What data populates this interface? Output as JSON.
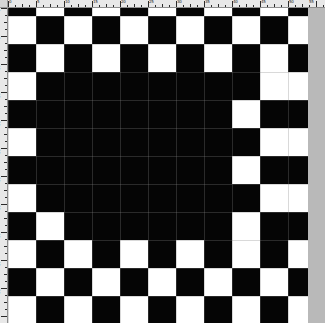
{
  "app": {
    "title": "Image Editor Canvas",
    "document_name": "Untitled"
  },
  "rulers": {
    "unit": "px",
    "horizontal": {
      "name": "horizontal-ruler",
      "orientation": "horizontal",
      "origin_px": 0,
      "minor_tick_step": 7,
      "major_tick_step": 28,
      "labels": [
        "0",
        "5",
        "10",
        "15",
        "20",
        "25",
        "30",
        "35",
        "40",
        "45",
        "50",
        "55"
      ],
      "label_positions": [
        0,
        28,
        56,
        84,
        112,
        140,
        168,
        196,
        224,
        252,
        280,
        300
      ]
    },
    "vertical": {
      "name": "vertical-ruler",
      "orientation": "vertical",
      "origin_px": 0,
      "minor_tick_step": 7,
      "major_tick_step": 28,
      "labels": [
        "0",
        "5",
        "10",
        "15",
        "20",
        "25",
        "30",
        "35",
        "40",
        "45",
        "50"
      ],
      "label_positions": [
        0,
        28,
        56,
        84,
        112,
        140,
        168,
        196,
        224,
        252,
        280
      ]
    }
  },
  "canvas": {
    "name": "drawing-canvas",
    "width": 300,
    "height": 315,
    "cell_size": 28,
    "columns": 11,
    "rows": 12,
    "row_offset": -20,
    "colors": {
      "fill": "#050505",
      "background": "#ffffff",
      "grid": "#808080",
      "gutter": "#b9b9b9",
      "ruler": "#e8e8e8"
    },
    "grid_visible": true,
    "pattern_description": "Checkerboard with a flood-filled solid black region in the centre",
    "cells": [
      [
        1,
        0,
        1,
        0,
        1,
        0,
        1,
        0,
        1,
        0,
        1
      ],
      [
        0,
        1,
        0,
        1,
        0,
        1,
        0,
        1,
        0,
        1,
        0
      ],
      [
        1,
        0,
        1,
        0,
        1,
        0,
        1,
        0,
        1,
        0,
        1
      ],
      [
        0,
        1,
        1,
        1,
        1,
        1,
        1,
        1,
        1,
        0,
        0
      ],
      [
        1,
        1,
        1,
        1,
        1,
        1,
        1,
        1,
        0,
        1,
        1
      ],
      [
        0,
        1,
        1,
        1,
        1,
        1,
        1,
        1,
        1,
        0,
        0
      ],
      [
        1,
        1,
        1,
        1,
        1,
        1,
        1,
        1,
        0,
        1,
        1
      ],
      [
        0,
        1,
        1,
        1,
        1,
        1,
        1,
        1,
        1,
        0,
        0
      ],
      [
        1,
        0,
        1,
        1,
        1,
        1,
        1,
        1,
        0,
        1,
        1
      ],
      [
        0,
        1,
        0,
        1,
        0,
        1,
        0,
        1,
        0,
        1,
        0
      ],
      [
        1,
        0,
        1,
        0,
        1,
        0,
        1,
        0,
        1,
        0,
        1
      ],
      [
        0,
        1,
        0,
        1,
        0,
        1,
        0,
        1,
        0,
        1,
        0
      ]
    ]
  }
}
